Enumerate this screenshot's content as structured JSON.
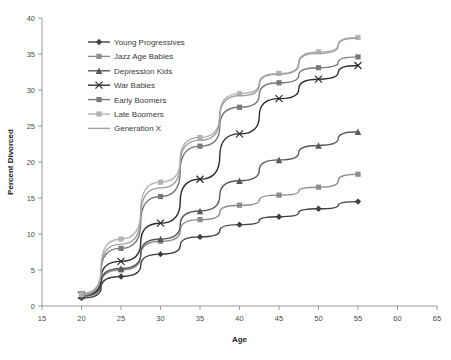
{
  "chart_data": {
    "type": "line",
    "title": "",
    "xlabel": "Age",
    "ylabel": "Percent Divorced",
    "xlim": [
      15,
      65
    ],
    "ylim": [
      0,
      40
    ],
    "xticks": [
      15,
      20,
      25,
      30,
      35,
      40,
      45,
      50,
      55,
      60,
      65
    ],
    "yticks": [
      0,
      5,
      10,
      15,
      20,
      25,
      30,
      35,
      40
    ],
    "grid": false,
    "legend_position": "upper-left-inside",
    "x": [
      20,
      25,
      30,
      35,
      40,
      45,
      50,
      55
    ],
    "series": [
      {
        "name": "Young Progressives",
        "marker": "diamond",
        "color": "#3f3f3f",
        "values": [
          1.1,
          4.1,
          7.2,
          9.6,
          11.3,
          12.4,
          13.5,
          14.5
        ]
      },
      {
        "name": "Jazz Age Babies",
        "marker": "square",
        "color": "#8c8c8c",
        "values": [
          1.3,
          5.0,
          9.0,
          12.0,
          14.0,
          15.4,
          16.5,
          18.3
        ]
      },
      {
        "name": "Depression Kids",
        "marker": "triangle",
        "color": "#595959",
        "values": [
          1.4,
          5.2,
          9.3,
          13.2,
          17.4,
          20.3,
          22.3,
          24.2
        ]
      },
      {
        "name": "War Babies",
        "marker": "cross",
        "color": "#2e2e2e",
        "values": [
          1.5,
          6.2,
          11.5,
          17.6,
          23.9,
          28.8,
          31.5,
          33.4
        ]
      },
      {
        "name": "Early Boomers",
        "marker": "square",
        "color": "#7a7a7a",
        "values": [
          1.7,
          8.0,
          15.2,
          22.2,
          27.6,
          31.0,
          33.1,
          34.6
        ]
      },
      {
        "name": "Late Boomers",
        "marker": "square",
        "color": "#b3b3b3",
        "values": [
          1.6,
          9.3,
          17.2,
          23.4,
          29.5,
          32.3,
          35.3,
          37.3
        ]
      },
      {
        "name": "Generation X",
        "marker": "none",
        "color": "#a0a0a0",
        "values": [
          1.5,
          8.6,
          16.4,
          23.0,
          29.2,
          32.2,
          35.1,
          37.2
        ]
      }
    ]
  },
  "legend": {
    "items": [
      {
        "label": "Young Progressives"
      },
      {
        "label": "Jazz Age Babies"
      },
      {
        "label": "Depression Kids"
      },
      {
        "label": "War Babies"
      },
      {
        "label": "Early Boomers"
      },
      {
        "label": "Late Boomers"
      },
      {
        "label": "Generation X"
      }
    ]
  }
}
